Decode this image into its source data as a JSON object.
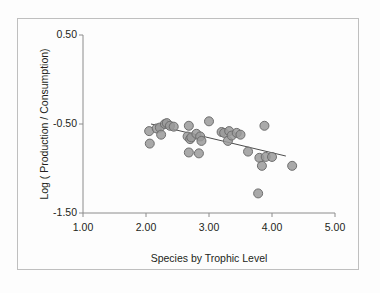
{
  "chart_data": {
    "type": "scatter",
    "title": "",
    "xlabel": "Species by Trophic Level",
    "ylabel": "Log ( Production / Consumption)",
    "xlim": [
      1.0,
      5.0
    ],
    "ylim": [
      -1.5,
      0.5
    ],
    "xticks": [
      1.0,
      2.0,
      3.0,
      4.0,
      5.0
    ],
    "xtick_labels": [
      "1.00",
      "2.00",
      "3.00",
      "4.00",
      "5.00"
    ],
    "yticks": [
      0.5,
      -0.5,
      -1.5
    ],
    "ytick_labels": [
      "0.50",
      "-0.50",
      "-1.50"
    ],
    "grid": false,
    "legend": "none",
    "marker": {
      "shape": "circle",
      "fill_color": "#9a9a9a",
      "edge_color": "#6e6e6e",
      "size_px": 9
    },
    "trendline": {
      "type": "linear-fit",
      "color": "#4d4d4d",
      "x_start": 2.08,
      "y_start": -0.5,
      "x_end": 4.22,
      "y_end": -0.86
    },
    "points": [
      {
        "x": 2.05,
        "y": -0.58
      },
      {
        "x": 2.06,
        "y": -0.72
      },
      {
        "x": 2.17,
        "y": -0.55
      },
      {
        "x": 2.22,
        "y": -0.54
      },
      {
        "x": 2.24,
        "y": -0.62
      },
      {
        "x": 2.3,
        "y": -0.5
      },
      {
        "x": 2.33,
        "y": -0.49
      },
      {
        "x": 2.38,
        "y": -0.52
      },
      {
        "x": 2.44,
        "y": -0.53
      },
      {
        "x": 2.66,
        "y": -0.64
      },
      {
        "x": 2.68,
        "y": -0.52
      },
      {
        "x": 2.68,
        "y": -0.82
      },
      {
        "x": 2.7,
        "y": -0.67
      },
      {
        "x": 2.72,
        "y": -0.65
      },
      {
        "x": 2.8,
        "y": -0.61
      },
      {
        "x": 2.84,
        "y": -0.83
      },
      {
        "x": 2.86,
        "y": -0.64
      },
      {
        "x": 2.88,
        "y": -0.69
      },
      {
        "x": 3.0,
        "y": -0.47
      },
      {
        "x": 3.2,
        "y": -0.59
      },
      {
        "x": 3.24,
        "y": -0.6
      },
      {
        "x": 3.3,
        "y": -0.69
      },
      {
        "x": 3.32,
        "y": -0.58
      },
      {
        "x": 3.36,
        "y": -0.63
      },
      {
        "x": 3.44,
        "y": -0.6
      },
      {
        "x": 3.5,
        "y": -0.62
      },
      {
        "x": 3.62,
        "y": -0.81
      },
      {
        "x": 3.78,
        "y": -1.28
      },
      {
        "x": 3.8,
        "y": -0.88
      },
      {
        "x": 3.84,
        "y": -0.97
      },
      {
        "x": 3.88,
        "y": -0.52
      },
      {
        "x": 3.9,
        "y": -0.87
      },
      {
        "x": 4.0,
        "y": -0.87
      },
      {
        "x": 4.32,
        "y": -0.97
      }
    ]
  },
  "axes": {
    "x_title": "Species by Trophic Level",
    "y_title": "Log ( Production / Consumption)",
    "x_tick_labels": [
      "1.00",
      "2.00",
      "3.00",
      "4.00",
      "5.00"
    ],
    "y_tick_labels": [
      "0.50",
      "-0.50",
      "-1.50"
    ]
  },
  "colors": {
    "marker_fill": "#9a9a9a",
    "marker_edge": "#6e6e6e",
    "axis": "#8c8c8c",
    "trendline": "#4d4d4d",
    "frame": "#bfbfbf",
    "text": "#231f20",
    "background": "#fdfdfd"
  }
}
